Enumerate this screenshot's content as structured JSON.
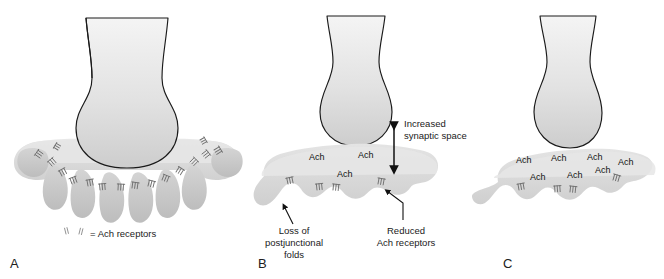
{
  "figure": {
    "background_color": "#ffffff",
    "line_color": "#1a1a1a",
    "nerve_fill_top": "#f2f2f2",
    "nerve_fill_bottom": "#cfcfcf",
    "muscle_fill": "#dcdcdc",
    "fold_fill": "#c6c6c6",
    "receptor_color": "#6f6f6f"
  },
  "panels": [
    {
      "id": "A",
      "letter": "A",
      "description": "Normal neuromuscular junction with abundant postjunctional folds and dense Ach receptors",
      "legend": {
        "symbol_name": "ach-receptor-symbol",
        "equals": "=",
        "label": "Ach receptors",
        "full_text": "= Ach receptors"
      },
      "ach_labels": [],
      "annotations": []
    },
    {
      "id": "B",
      "letter": "B",
      "description": "Denervated junction: flattened muscle surface, widened synaptic cleft and fewer receptors",
      "legend": null,
      "ach_labels": [
        {
          "text": "Ach",
          "x": 309,
          "y": 152
        },
        {
          "text": "Ach",
          "x": 358,
          "y": 150
        },
        {
          "text": "Ach",
          "x": 337,
          "y": 169
        }
      ],
      "annotations": [
        {
          "name": "increased-synaptic-space",
          "lines": [
            "Increased",
            "synaptic space"
          ],
          "text": "Increased synaptic space",
          "arrow": "double-headed-vertical-arrow"
        },
        {
          "name": "loss-of-postjunctional-folds",
          "lines": [
            "Loss of",
            "postjunctional",
            "folds"
          ],
          "text": "Loss of postjunctional folds",
          "arrow": "pointer-arrow-up-right"
        },
        {
          "name": "reduced-ach-receptors",
          "lines": [
            "Reduced",
            "Ach receptors"
          ],
          "text": "Reduced Ach receptors",
          "arrow": "pointer-arrow-up-left"
        }
      ]
    },
    {
      "id": "C",
      "letter": "C",
      "description": "Junction with excess acetylcholine accumulating in a widened cleft",
      "legend": null,
      "ach_labels": [
        {
          "text": "Ach",
          "x": 516,
          "y": 155
        },
        {
          "text": "Ach",
          "x": 551,
          "y": 153
        },
        {
          "text": "Ach",
          "x": 587,
          "y": 152
        },
        {
          "text": "Ach",
          "x": 618,
          "y": 157
        },
        {
          "text": "Ach",
          "x": 595,
          "y": 165
        },
        {
          "text": "Ach",
          "x": 530,
          "y": 172
        },
        {
          "text": "Ach",
          "x": 567,
          "y": 170
        }
      ],
      "annotations": []
    }
  ],
  "panel_letters": [
    {
      "letter": "A",
      "x": 10,
      "y": 256
    },
    {
      "letter": "B",
      "x": 258,
      "y": 256
    },
    {
      "letter": "C",
      "x": 503,
      "y": 256
    }
  ]
}
